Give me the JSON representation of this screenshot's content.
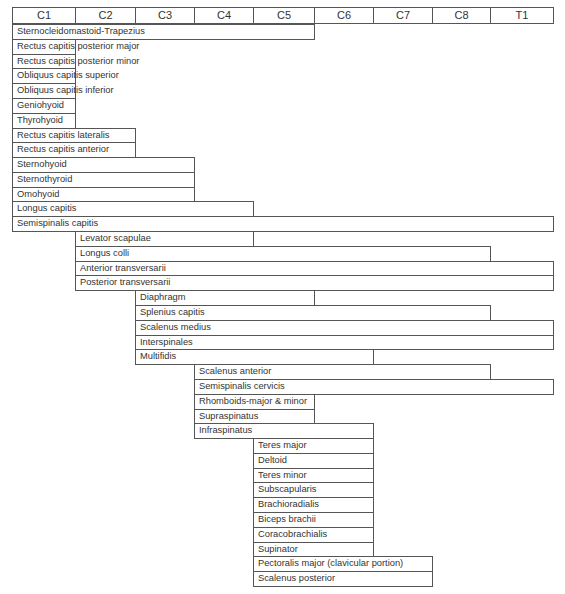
{
  "chart_data": {
    "type": "table",
    "title": "",
    "columns": [
      "C1",
      "C2",
      "C3",
      "C4",
      "C5",
      "C6",
      "C7",
      "C8",
      "T1"
    ],
    "rows": [
      {
        "label": "Sternocleidomastoid-Trapezius",
        "start": "C1",
        "end": "C5"
      },
      {
        "label": "Rectus capitis posterior major",
        "start": "C1",
        "end": "C1"
      },
      {
        "label": "Rectus capitis posterior minor",
        "start": "C1",
        "end": "C1"
      },
      {
        "label": "Obliquus capitis superior",
        "start": "C1",
        "end": "C1"
      },
      {
        "label": "Obliquus capitis inferior",
        "start": "C1",
        "end": "C1"
      },
      {
        "label": "Geniohyoid",
        "start": "C1",
        "end": "C1"
      },
      {
        "label": "Thyrohyoid",
        "start": "C1",
        "end": "C1"
      },
      {
        "label": "Rectus capitis lateralis",
        "start": "C1",
        "end": "C2"
      },
      {
        "label": "Rectus capitis anterior",
        "start": "C1",
        "end": "C2"
      },
      {
        "label": "Sternohyoid",
        "start": "C1",
        "end": "C3"
      },
      {
        "label": "Sternothyroid",
        "start": "C1",
        "end": "C3"
      },
      {
        "label": "Omohyoid",
        "start": "C1",
        "end": "C3"
      },
      {
        "label": "Longus capitis",
        "start": "C1",
        "end": "C4"
      },
      {
        "label": "Semispinalis capitis",
        "start": "C1",
        "end": "T1"
      },
      {
        "label": "Levator scapulae",
        "start": "C2",
        "end": "C4"
      },
      {
        "label": "Longus colli",
        "start": "C2",
        "end": "C8"
      },
      {
        "label": "Anterior transversarii",
        "start": "C2",
        "end": "T1"
      },
      {
        "label": "Posterior transversarii",
        "start": "C2",
        "end": "T1"
      },
      {
        "label": "Diaphragm",
        "start": "C3",
        "end": "C5"
      },
      {
        "label": "Splenius capitis",
        "start": "C3",
        "end": "C8"
      },
      {
        "label": "Scalenus medius",
        "start": "C3",
        "end": "T1"
      },
      {
        "label": "Interspinales",
        "start": "C3",
        "end": "T1"
      },
      {
        "label": "Multifidis",
        "start": "C3",
        "end": "C6"
      },
      {
        "label": "Scalenus anterior",
        "start": "C4",
        "end": "C8"
      },
      {
        "label": "Semispinalis cervicis",
        "start": "C4",
        "end": "T1"
      },
      {
        "label": "Rhomboids-major & minor",
        "start": "C4",
        "end": "C5"
      },
      {
        "label": "Supraspinatus",
        "start": "C4",
        "end": "C5"
      },
      {
        "label": "Infraspinatus",
        "start": "C4",
        "end": "C6"
      },
      {
        "label": "Teres major",
        "start": "C5",
        "end": "C6"
      },
      {
        "label": "Deltoid",
        "start": "C5",
        "end": "C6"
      },
      {
        "label": "Teres minor",
        "start": "C5",
        "end": "C6"
      },
      {
        "label": "Subscapularis",
        "start": "C5",
        "end": "C6"
      },
      {
        "label": "Brachioradialis",
        "start": "C5",
        "end": "C6"
      },
      {
        "label": "Biceps brachii",
        "start": "C5",
        "end": "C6"
      },
      {
        "label": "Coracobrachialis",
        "start": "C5",
        "end": "C6"
      },
      {
        "label": "Supinator",
        "start": "C5",
        "end": "C6"
      },
      {
        "label": "Pectoralis major (clavicular portion)",
        "start": "C5",
        "end": "C7"
      },
      {
        "label": "Scalenus posterior",
        "start": "C5",
        "end": "C7"
      }
    ]
  },
  "layout": {
    "col_edges": [
      12,
      75,
      135,
      194,
      253,
      314,
      373,
      432,
      490,
      553
    ],
    "header_top": 7,
    "header_height": 17,
    "row_top": 24,
    "row_height": 15.2
  }
}
